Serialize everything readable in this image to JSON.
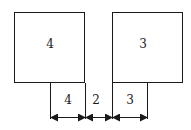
{
  "diagram": {
    "left_box": {
      "label": "4"
    },
    "right_box": {
      "label": "3"
    },
    "dimensions": [
      {
        "label": "4"
      },
      {
        "label": "2"
      },
      {
        "label": "3"
      }
    ],
    "stroke_color": "#1a1a1a"
  }
}
